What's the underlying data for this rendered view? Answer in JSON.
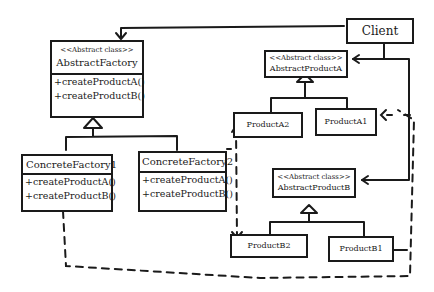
{
  "diagram": {
    "type": "uml-class-diagram",
    "pattern": "Abstract Factory",
    "classes": {
      "client": {
        "name": "Client"
      },
      "abstract_factory": {
        "stereotype": "<<Abstract class>>",
        "name": "AbstractFactory",
        "operations": [
          "+createProductA()",
          "+createProductB()"
        ]
      },
      "concrete_factory_1": {
        "name": "ConcreteFactory1",
        "operations": [
          "+createProductA()",
          "+createProductB()"
        ]
      },
      "concrete_factory_2": {
        "name": "ConcreteFactory2",
        "operations": [
          "+createProductA()",
          "+createProductB()"
        ]
      },
      "abstract_product_a": {
        "stereotype": "<<Abstract class>>",
        "name": "AbstractProductA"
      },
      "product_a2": {
        "name": "ProductA2"
      },
      "product_a1": {
        "name": "ProductA1"
      },
      "abstract_product_b": {
        "stereotype": "<<Abstract class>>",
        "name": "AbstractProductB"
      },
      "product_b2": {
        "name": "ProductB2"
      },
      "product_b1": {
        "name": "ProductB1"
      }
    },
    "relationships": [
      {
        "from": "Client",
        "to": "AbstractFactory",
        "kind": "association"
      },
      {
        "from": "Client",
        "to": "AbstractProductA",
        "kind": "association"
      },
      {
        "from": "Client",
        "to": "AbstractProductB",
        "kind": "association"
      },
      {
        "from": "ConcreteFactory1",
        "to": "AbstractFactory",
        "kind": "inheritance"
      },
      {
        "from": "ConcreteFactory2",
        "to": "AbstractFactory",
        "kind": "inheritance"
      },
      {
        "from": "ProductA2",
        "to": "AbstractProductA",
        "kind": "inheritance"
      },
      {
        "from": "ProductA1",
        "to": "AbstractProductA",
        "kind": "inheritance"
      },
      {
        "from": "ProductB2",
        "to": "AbstractProductB",
        "kind": "inheritance"
      },
      {
        "from": "ProductB1",
        "to": "AbstractProductB",
        "kind": "inheritance"
      },
      {
        "from": "ConcreteFactory2",
        "to": "ProductA2",
        "kind": "dependency"
      },
      {
        "from": "ConcreteFactory2",
        "to": "ProductB2",
        "kind": "dependency"
      },
      {
        "from": "ConcreteFactory1",
        "to": "ProductA1",
        "kind": "dependency"
      },
      {
        "from": "ConcreteFactory1",
        "to": "ProductB1",
        "kind": "dependency"
      }
    ]
  }
}
